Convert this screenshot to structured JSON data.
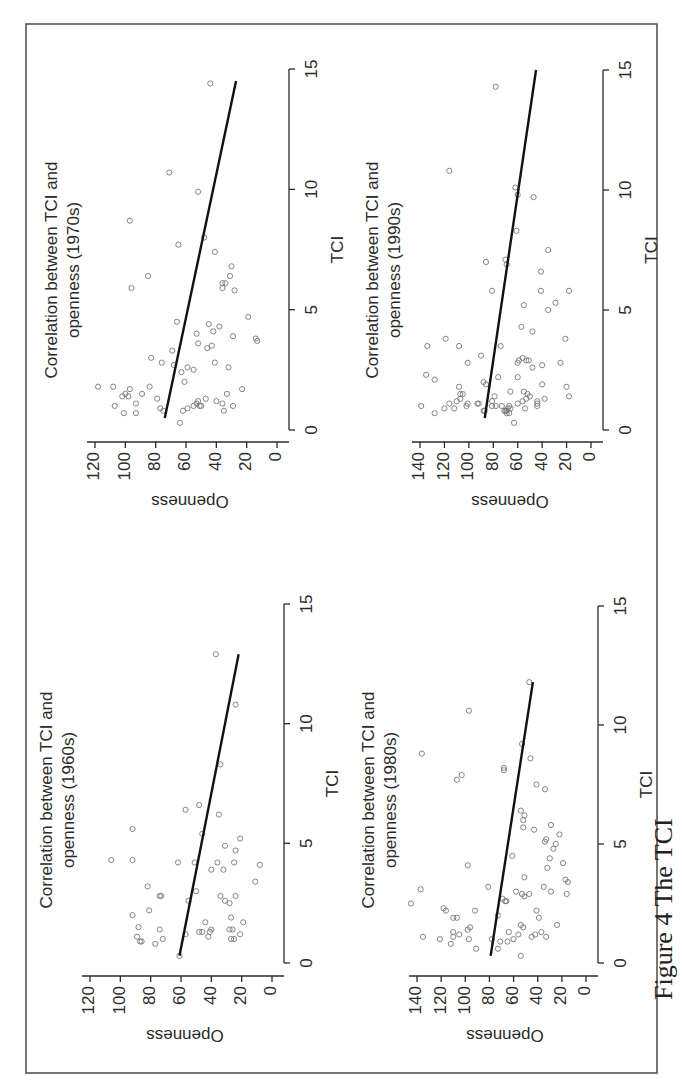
{
  "figure": {
    "caption_visible": "Figure 4  The TCI",
    "rotation": "page rotated 90 degrees clockwise; plot text reads bottom-to-top"
  },
  "chart_data": [
    {
      "type": "scatter",
      "title": "Correlation between TCI and openness (1970s)",
      "title_lines": [
        "Correlation between TCI and",
        "openness (1970s)"
      ],
      "xlabel": "TCI",
      "ylabel": "Openness",
      "xlim": [
        0,
        15
      ],
      "ylim": [
        0,
        120
      ],
      "xticks": [
        0,
        5,
        10,
        15
      ],
      "yticks": [
        0,
        20,
        40,
        60,
        80,
        100,
        120
      ],
      "grid": false,
      "fit_line": {
        "x": [
          0.5,
          14.5
        ],
        "y": [
          74,
          27
        ]
      },
      "points": [
        [
          14.4,
          44
        ],
        [
          10.7,
          71
        ],
        [
          9.9,
          52
        ],
        [
          8.7,
          97
        ],
        [
          8.0,
          48
        ],
        [
          7.7,
          65
        ],
        [
          7.4,
          41
        ],
        [
          6.8,
          30
        ],
        [
          6.4,
          31
        ],
        [
          6.4,
          85
        ],
        [
          6.1,
          36
        ],
        [
          6.1,
          34
        ],
        [
          5.9,
          96
        ],
        [
          5.9,
          36
        ],
        [
          5.8,
          28
        ],
        [
          4.7,
          19
        ],
        [
          4.5,
          66
        ],
        [
          4.4,
          45
        ],
        [
          4.3,
          38
        ],
        [
          4.1,
          42
        ],
        [
          4.0,
          53
        ],
        [
          3.9,
          29
        ],
        [
          3.8,
          14
        ],
        [
          3.7,
          13
        ],
        [
          3.6,
          52
        ],
        [
          3.5,
          43
        ],
        [
          3.4,
          46
        ],
        [
          3.3,
          69
        ],
        [
          3.0,
          83
        ],
        [
          2.8,
          41
        ],
        [
          2.8,
          76
        ],
        [
          2.7,
          68
        ],
        [
          2.6,
          32
        ],
        [
          2.6,
          59
        ],
        [
          2.5,
          55
        ],
        [
          2.4,
          63
        ],
        [
          2.0,
          61
        ],
        [
          1.8,
          118
        ],
        [
          1.8,
          108
        ],
        [
          1.8,
          84
        ],
        [
          1.7,
          97
        ],
        [
          1.7,
          23
        ],
        [
          1.5,
          33
        ],
        [
          1.5,
          89
        ],
        [
          1.5,
          100
        ],
        [
          1.4,
          98
        ],
        [
          1.4,
          102
        ],
        [
          1.3,
          79
        ],
        [
          1.3,
          47
        ],
        [
          1.2,
          40
        ],
        [
          1.2,
          52
        ],
        [
          1.1,
          53
        ],
        [
          1.1,
          36
        ],
        [
          1.1,
          93
        ],
        [
          1.0,
          50
        ],
        [
          1.0,
          55
        ],
        [
          1.0,
          51
        ],
        [
          1.0,
          107
        ],
        [
          1.0,
          29
        ],
        [
          0.9,
          77
        ],
        [
          0.9,
          59
        ],
        [
          0.8,
          62
        ],
        [
          0.8,
          75
        ],
        [
          0.8,
          35
        ],
        [
          0.7,
          101
        ],
        [
          0.7,
          93
        ],
        [
          0.3,
          64
        ]
      ]
    },
    {
      "type": "scatter",
      "title": "Correlation between TCI and openness (1990s)",
      "title_lines": [
        "Correlation between TCI and",
        "openness (1990s)"
      ],
      "xlabel": "TCI",
      "ylabel": "Openness",
      "xlim": [
        0,
        15
      ],
      "ylim": [
        0,
        140
      ],
      "xticks": [
        0,
        5,
        10,
        15
      ],
      "yticks": [
        0,
        20,
        40,
        60,
        80,
        100,
        120,
        140
      ],
      "grid": false,
      "fit_line": {
        "x": [
          0.5,
          15
        ],
        "y": [
          87,
          45
        ]
      },
      "points": [
        [
          14.3,
          78
        ],
        [
          10.8,
          116
        ],
        [
          10.1,
          62
        ],
        [
          9.8,
          60
        ],
        [
          9.7,
          47
        ],
        [
          8.3,
          61
        ],
        [
          7.5,
          35
        ],
        [
          7.1,
          70
        ],
        [
          7.0,
          86
        ],
        [
          6.9,
          69
        ],
        [
          6.6,
          41
        ],
        [
          5.8,
          41
        ],
        [
          5.8,
          81
        ],
        [
          5.8,
          18
        ],
        [
          5.3,
          29
        ],
        [
          5.2,
          55
        ],
        [
          5.0,
          35
        ],
        [
          4.3,
          57
        ],
        [
          4.1,
          48
        ],
        [
          3.8,
          21
        ],
        [
          3.8,
          119
        ],
        [
          3.5,
          134
        ],
        [
          3.5,
          108
        ],
        [
          3.5,
          74
        ],
        [
          3.1,
          90
        ],
        [
          3.0,
          56
        ],
        [
          2.9,
          53
        ],
        [
          2.9,
          59
        ],
        [
          2.9,
          51
        ],
        [
          2.8,
          60
        ],
        [
          2.8,
          101
        ],
        [
          2.8,
          25
        ],
        [
          2.7,
          40
        ],
        [
          2.6,
          48
        ],
        [
          2.3,
          135
        ],
        [
          2.2,
          76
        ],
        [
          2.2,
          60
        ],
        [
          2.1,
          128
        ],
        [
          2.0,
          88
        ],
        [
          1.9,
          86
        ],
        [
          1.9,
          40
        ],
        [
          1.8,
          20
        ],
        [
          1.8,
          108
        ],
        [
          1.6,
          66
        ],
        [
          1.6,
          55
        ],
        [
          1.5,
          105
        ],
        [
          1.5,
          107
        ],
        [
          1.5,
          52
        ],
        [
          1.4,
          79
        ],
        [
          1.4,
          18
        ],
        [
          1.4,
          50
        ],
        [
          1.3,
          38
        ],
        [
          1.3,
          107
        ],
        [
          1.3,
          53
        ],
        [
          1.2,
          81
        ],
        [
          1.2,
          56
        ],
        [
          1.2,
          44
        ],
        [
          1.2,
          110
        ],
        [
          1.1,
          116
        ],
        [
          1.1,
          44
        ],
        [
          1.1,
          93
        ],
        [
          1.1,
          92
        ],
        [
          1.1,
          101
        ],
        [
          1.1,
          60
        ],
        [
          1.0,
          81
        ],
        [
          1.0,
          44
        ],
        [
          1.0,
          139
        ],
        [
          1.0,
          102
        ],
        [
          1.0,
          67
        ],
        [
          1.0,
          78
        ],
        [
          1.0,
          73
        ],
        [
          0.9,
          120
        ],
        [
          0.9,
          112
        ],
        [
          0.9,
          54
        ],
        [
          0.9,
          66
        ],
        [
          0.9,
          68
        ],
        [
          0.8,
          88
        ],
        [
          0.8,
          87
        ],
        [
          0.8,
          71
        ],
        [
          0.8,
          70
        ],
        [
          0.8,
          69
        ],
        [
          0.7,
          128
        ],
        [
          0.7,
          67
        ],
        [
          0.7,
          69
        ],
        [
          0.3,
          63
        ]
      ]
    },
    {
      "type": "scatter",
      "title": "Correlation between TCI and openness (1960s)",
      "title_lines": [
        "Correlation between TCI and",
        "openness (1960s)"
      ],
      "xlabel": "TCI",
      "ylabel": "Openness",
      "xlim": [
        0,
        15
      ],
      "ylim": [
        0,
        120
      ],
      "xticks": [
        0,
        5,
        10,
        15
      ],
      "yticks": [
        0,
        20,
        40,
        60,
        80,
        100,
        120
      ],
      "grid": false,
      "fit_line": {
        "x": [
          0.3,
          12.9
        ],
        "y": [
          61,
          22
        ]
      },
      "points": [
        [
          12.9,
          37
        ],
        [
          10.8,
          24
        ],
        [
          8.3,
          34
        ],
        [
          6.4,
          57
        ],
        [
          6.6,
          48
        ],
        [
          6.2,
          35
        ],
        [
          5.6,
          92
        ],
        [
          5.4,
          46
        ],
        [
          5.2,
          21
        ],
        [
          4.9,
          31
        ],
        [
          4.7,
          24
        ],
        [
          4.3,
          106
        ],
        [
          4.3,
          92
        ],
        [
          4.2,
          62
        ],
        [
          4.2,
          51
        ],
        [
          4.2,
          36
        ],
        [
          4.2,
          25
        ],
        [
          4.1,
          8
        ],
        [
          3.9,
          40
        ],
        [
          3.9,
          32
        ],
        [
          3.4,
          11
        ],
        [
          3.2,
          82
        ],
        [
          3.0,
          50
        ],
        [
          2.8,
          73
        ],
        [
          2.8,
          74
        ],
        [
          2.8,
          34
        ],
        [
          2.8,
          24
        ],
        [
          2.6,
          55
        ],
        [
          2.6,
          31
        ],
        [
          2.5,
          28
        ],
        [
          2.2,
          81
        ],
        [
          2.0,
          92
        ],
        [
          1.9,
          27
        ],
        [
          1.7,
          44
        ],
        [
          1.7,
          19
        ],
        [
          1.5,
          88
        ],
        [
          1.4,
          74
        ],
        [
          1.4,
          40
        ],
        [
          1.4,
          28
        ],
        [
          1.4,
          26
        ],
        [
          1.3,
          48
        ],
        [
          1.3,
          41
        ],
        [
          1.3,
          46
        ],
        [
          1.2,
          57
        ],
        [
          1.2,
          21
        ],
        [
          1.1,
          89
        ],
        [
          1.1,
          42
        ],
        [
          1.0,
          72
        ],
        [
          1.0,
          27
        ],
        [
          1.0,
          25
        ],
        [
          0.9,
          87
        ],
        [
          0.9,
          86
        ],
        [
          0.8,
          77
        ],
        [
          0.3,
          61
        ]
      ]
    },
    {
      "type": "scatter",
      "title": "Correlation between TCI and openness (1980s)",
      "title_lines": [
        "Correlation between TCI and",
        "openness (1980s)"
      ],
      "xlabel": "TCI",
      "ylabel": "Openness",
      "xlim": [
        0,
        15
      ],
      "ylim": [
        0,
        140
      ],
      "xticks": [
        0,
        5,
        10,
        15
      ],
      "yticks": [
        0,
        20,
        40,
        60,
        80,
        100,
        120,
        140
      ],
      "grid": false,
      "fit_line": {
        "x": [
          0.3,
          11.8
        ],
        "y": [
          79,
          44
        ]
      },
      "points": [
        [
          11.8,
          47
        ],
        [
          10.6,
          97
        ],
        [
          9.2,
          53
        ],
        [
          8.8,
          136
        ],
        [
          8.6,
          46
        ],
        [
          8.2,
          68
        ],
        [
          8.1,
          68
        ],
        [
          7.9,
          103
        ],
        [
          7.7,
          107
        ],
        [
          7.5,
          41
        ],
        [
          7.3,
          34
        ],
        [
          6.4,
          54
        ],
        [
          6.2,
          51
        ],
        [
          6.0,
          52
        ],
        [
          5.7,
          52
        ],
        [
          5.8,
          29
        ],
        [
          5.6,
          43
        ],
        [
          5.4,
          22
        ],
        [
          5.2,
          33
        ],
        [
          5.1,
          34
        ],
        [
          5.0,
          25
        ],
        [
          4.8,
          27
        ],
        [
          4.5,
          61
        ],
        [
          4.4,
          30
        ],
        [
          4.2,
          19
        ],
        [
          4.1,
          98
        ],
        [
          4.0,
          32
        ],
        [
          3.6,
          51
        ],
        [
          3.5,
          17
        ],
        [
          3.4,
          15
        ],
        [
          3.2,
          81
        ],
        [
          3.2,
          35
        ],
        [
          3.1,
          137
        ],
        [
          3.0,
          58
        ],
        [
          3.0,
          29
        ],
        [
          2.9,
          47
        ],
        [
          2.9,
          16
        ],
        [
          2.9,
          53
        ],
        [
          2.8,
          51
        ],
        [
          2.7,
          69
        ],
        [
          2.6,
          67
        ],
        [
          2.6,
          66
        ],
        [
          2.5,
          145
        ],
        [
          2.3,
          118
        ],
        [
          2.2,
          116
        ],
        [
          2.2,
          41
        ],
        [
          2.2,
          92
        ],
        [
          2.0,
          73
        ],
        [
          1.9,
          107
        ],
        [
          1.9,
          110
        ],
        [
          1.9,
          39
        ],
        [
          1.6,
          24
        ],
        [
          1.6,
          54
        ],
        [
          1.5,
          52
        ],
        [
          1.5,
          96
        ],
        [
          1.4,
          98
        ],
        [
          1.3,
          37
        ],
        [
          1.3,
          64
        ],
        [
          1.3,
          110
        ],
        [
          1.2,
          105
        ],
        [
          1.2,
          42
        ],
        [
          1.2,
          56
        ],
        [
          1.1,
          45
        ],
        [
          1.1,
          33
        ],
        [
          1.1,
          110
        ],
        [
          1.1,
          135
        ],
        [
          1.0,
          78
        ],
        [
          1.0,
          60
        ],
        [
          1.0,
          97
        ],
        [
          1.0,
          121
        ],
        [
          0.9,
          71
        ],
        [
          0.9,
          65
        ],
        [
          0.8,
          112
        ],
        [
          0.6,
          91
        ],
        [
          0.6,
          73
        ],
        [
          0.3,
          54
        ]
      ]
    }
  ]
}
